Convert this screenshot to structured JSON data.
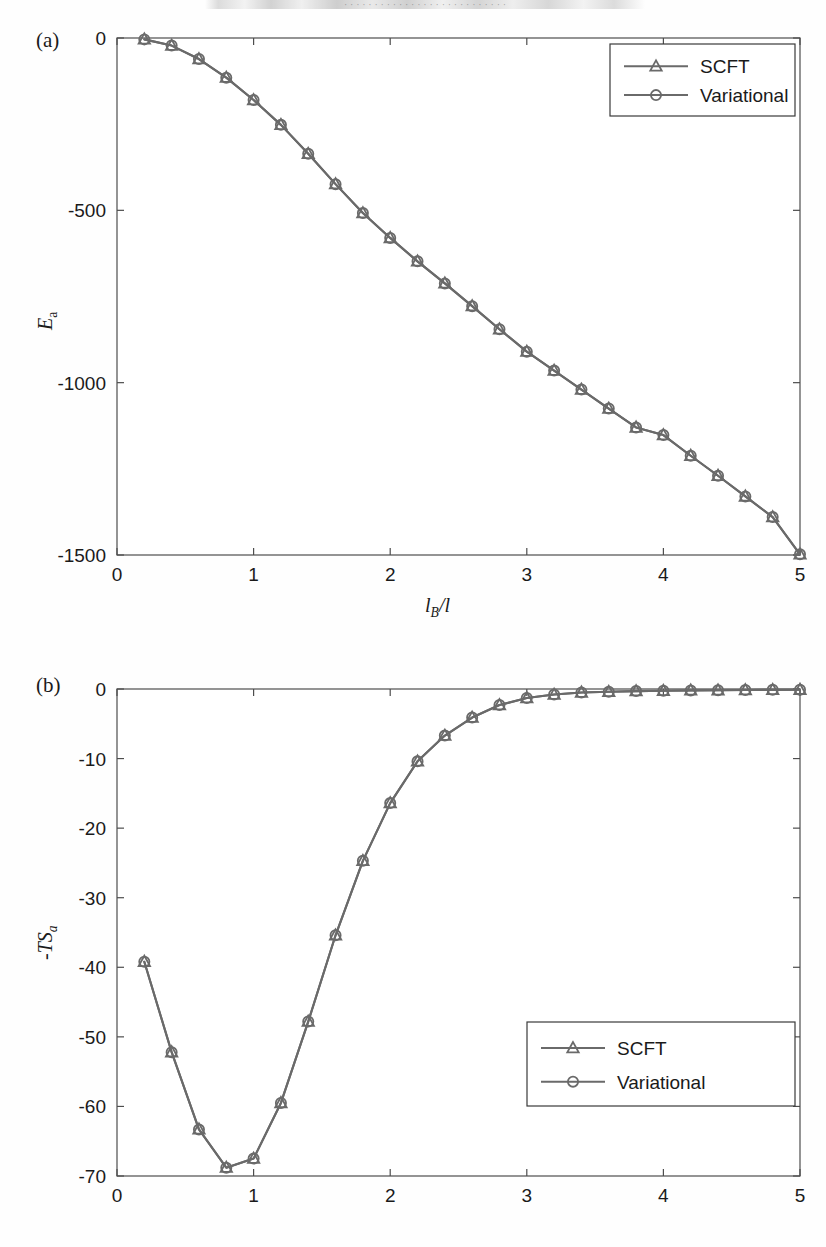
{
  "page": {
    "header_fragment": "· · · · · · · · · · · · · · · · · · · · · · · · · · ·"
  },
  "panel_a": {
    "tag": "(a)",
    "ylabel_main": "E",
    "ylabel_sub": "a",
    "xlabel_main": "l",
    "xlabel_sub": "B",
    "xlabel_tail": "/l",
    "xticks": [
      "0",
      "1",
      "2",
      "3",
      "4",
      "5"
    ],
    "yticks": [
      "0",
      "-500",
      "-1000",
      "-1500"
    ],
    "legend": {
      "scft": "SCFT",
      "variational": "Variational"
    }
  },
  "panel_b": {
    "tag": "(b)",
    "ylabel_main": "-TS",
    "ylabel_sub": "a",
    "xticks": [
      "0",
      "1",
      "2",
      "3",
      "4",
      "5"
    ],
    "yticks": [
      "0",
      "-10",
      "-20",
      "-30",
      "-40",
      "-50",
      "-60",
      "-70"
    ],
    "legend": {
      "scft": "SCFT",
      "variational": "Variational"
    }
  },
  "style": {
    "series_color": "#6a6a6a",
    "axis_color": "#4d4d4d",
    "text_color": "#1a1a1a",
    "background": "#ffffff"
  },
  "chart_data": [
    {
      "type": "line",
      "id": "panel-a",
      "title": "(a)",
      "xlabel": "l_B/l",
      "ylabel": "E_a",
      "xlim": [
        0,
        5
      ],
      "ylim": [
        -1500,
        0
      ],
      "xticks": [
        0,
        1,
        2,
        3,
        4,
        5
      ],
      "yticks": [
        0,
        -500,
        -1000,
        -1500
      ],
      "grid": false,
      "legend_position": "top-right",
      "x": [
        0.2,
        0.4,
        0.6,
        0.8,
        1.0,
        1.2,
        1.4,
        1.6,
        1.8,
        2.0,
        2.2,
        2.4,
        2.6,
        2.8,
        3.0,
        3.2,
        3.4,
        3.6,
        3.8,
        4.0,
        4.2,
        4.4,
        4.6,
        4.8,
        5.0
      ],
      "series": [
        {
          "name": "SCFT",
          "marker": "triangle",
          "values": [
            -4,
            -22,
            -61,
            -115,
            -180,
            -252,
            -336,
            -424,
            -508,
            -580,
            -648,
            -712,
            -778,
            -845,
            -910,
            -965,
            -1020,
            -1075,
            -1130,
            -1152,
            -1212,
            -1270,
            -1330,
            -1390,
            -1498
          ]
        },
        {
          "name": "Variational",
          "marker": "circle",
          "values": [
            -4,
            -22,
            -61,
            -115,
            -180,
            -252,
            -336,
            -424,
            -508,
            -580,
            -648,
            -712,
            -778,
            -845,
            -910,
            -965,
            -1020,
            -1075,
            -1130,
            -1152,
            -1212,
            -1270,
            -1330,
            -1390,
            -1498
          ]
        }
      ]
    },
    {
      "type": "line",
      "id": "panel-b",
      "title": "(b)",
      "xlabel": "l_B/l",
      "ylabel": "-TS_a",
      "xlim": [
        0,
        5
      ],
      "ylim": [
        -70,
        0
      ],
      "xticks": [
        0,
        1,
        2,
        3,
        4,
        5
      ],
      "yticks": [
        0,
        -10,
        -20,
        -30,
        -40,
        -50,
        -60,
        -70
      ],
      "grid": false,
      "legend_position": "bottom-right",
      "x": [
        0.2,
        0.4,
        0.6,
        0.8,
        1.0,
        1.2,
        1.4,
        1.6,
        1.8,
        2.0,
        2.2,
        2.4,
        2.6,
        2.8,
        3.0,
        3.2,
        3.4,
        3.6,
        3.8,
        4.0,
        4.2,
        4.4,
        4.6,
        4.8,
        5.0
      ],
      "series": [
        {
          "name": "SCFT",
          "marker": "triangle",
          "values": [
            -39.2,
            -52.2,
            -63.3,
            -68.8,
            -67.5,
            -59.5,
            -47.8,
            -35.4,
            -24.7,
            -16.4,
            -10.4,
            -6.7,
            -4.1,
            -2.3,
            -1.3,
            -0.8,
            -0.5,
            -0.4,
            -0.3,
            -0.25,
            -0.2,
            -0.18,
            -0.15,
            -0.12,
            -0.1
          ]
        },
        {
          "name": "Variational",
          "marker": "circle",
          "values": [
            -39.2,
            -52.2,
            -63.3,
            -68.8,
            -67.5,
            -59.5,
            -47.8,
            -35.4,
            -24.7,
            -16.4,
            -10.4,
            -6.7,
            -4.1,
            -2.3,
            -1.3,
            -0.8,
            -0.5,
            -0.4,
            -0.3,
            -0.25,
            -0.2,
            -0.18,
            -0.15,
            -0.12,
            -0.1
          ]
        }
      ]
    }
  ]
}
